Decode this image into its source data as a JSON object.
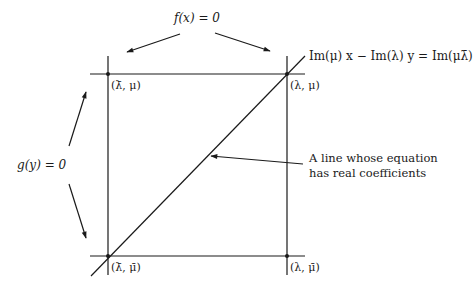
{
  "diagram": {
    "labels": {
      "f_equation": "f(x) = 0",
      "g_equation": "g(y) = 0",
      "line_equation": "Im(μ) x − Im(λ) y = Im(μλ̄)",
      "annotation_line1": "A line whose equation",
      "annotation_line2": "has real coefficients"
    },
    "points": [
      {
        "id": "top-left",
        "label": "(λ̄, μ)",
        "x": 108,
        "y": 74
      },
      {
        "id": "top-right",
        "label": "(λ, μ)",
        "x": 287,
        "y": 74
      },
      {
        "id": "bottom-left",
        "label": "(λ̄, μ̄)",
        "x": 108,
        "y": 256
      },
      {
        "id": "bottom-right",
        "label": "(λ, μ̄)",
        "x": 287,
        "y": 256
      }
    ],
    "colors": {
      "stroke": "#1a1a1a",
      "background": "#ffffff"
    }
  }
}
